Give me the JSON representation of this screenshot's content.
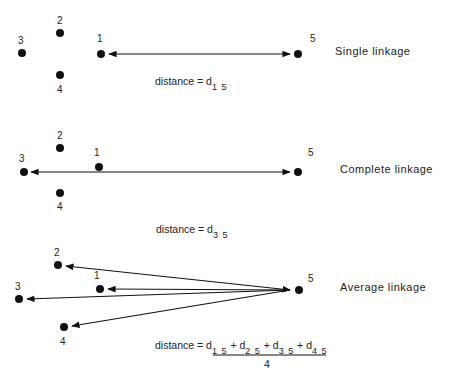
{
  "panels": [
    {
      "title": "Single linkage",
      "points": {
        "1": "1",
        "2": "2",
        "3": "3",
        "4": "4",
        "5": "5"
      },
      "distance_label": "distance =",
      "distance_symbol": "d",
      "distance_sub": "1 5"
    },
    {
      "title": "Complete linkage",
      "points": {
        "1": "1",
        "2": "2",
        "3": "3",
        "4": "4",
        "5": "5"
      },
      "distance_label": "distance =",
      "distance_symbol": "d",
      "distance_sub": "3 5"
    },
    {
      "title": "Average linkage",
      "points": {
        "1": "1",
        "2": "2",
        "3": "3",
        "4": "4",
        "5": "5"
      },
      "distance_label": "distance =",
      "numerator_terms": [
        {
          "symbol": "d",
          "sub": "1 5"
        },
        {
          "symbol": "d",
          "sub": "2 5"
        },
        {
          "symbol": "d",
          "sub": "3 5"
        },
        {
          "symbol": "d",
          "sub": "4 5"
        }
      ],
      "plus": "+",
      "denominator": "4"
    }
  ],
  "colors": {
    "ink": "#111111",
    "background": "#ffffff"
  }
}
